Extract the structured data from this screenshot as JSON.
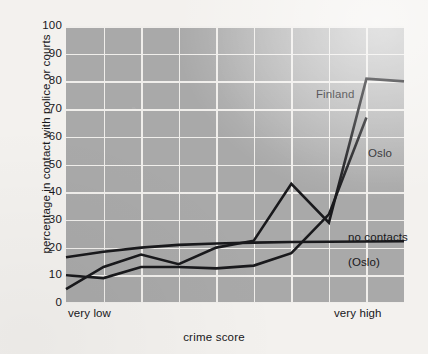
{
  "chart_data": {
    "type": "line",
    "title": "",
    "xlabel": "crime score",
    "ylabel": "percentage in contact with police or courts",
    "ylim": [
      0,
      100
    ],
    "ytick_labels": [
      "0",
      "10",
      "20",
      "30",
      "40",
      "50",
      "60",
      "70",
      "80",
      "90",
      "100"
    ],
    "ytick_values": [
      0,
      10,
      20,
      30,
      40,
      50,
      60,
      70,
      80,
      90,
      100
    ],
    "xtick_labels": [
      "very low",
      "very high"
    ],
    "x_categories": [
      1,
      2,
      3,
      4,
      5,
      6,
      7,
      8,
      9,
      10
    ],
    "grid": true,
    "grid_vertical_count": 8,
    "legend_position": "inline-annotations",
    "plot_background_color": "#a9a9a9",
    "page_background_color": "#f3f1ee",
    "gridline_color": "#f0eeeb",
    "line_color": "#19191c",
    "series": [
      {
        "name": "Finland",
        "label": "Finland",
        "x": [
          1,
          2,
          3,
          4,
          5,
          6,
          7,
          8,
          9,
          10
        ],
        "values": [
          5,
          13,
          17.5,
          14,
          20,
          22.5,
          43,
          29,
          81,
          80
        ]
      },
      {
        "name": "Oslo",
        "label": "Oslo",
        "x": [
          1,
          2,
          3,
          4,
          5,
          6,
          7,
          8,
          9
        ],
        "values": [
          10,
          9,
          13,
          13,
          12.5,
          13.5,
          18,
          32,
          67
        ]
      },
      {
        "name": "no contacts (Oslo)",
        "label": "no contacts",
        "sublabel": "(Oslo)",
        "x": [
          1,
          2,
          3,
          4,
          5,
          6,
          7,
          8,
          9,
          10
        ],
        "values": [
          16.5,
          18.5,
          20,
          21,
          21.5,
          21.8,
          22,
          22.1,
          22.2,
          22.3
        ]
      }
    ],
    "annotations": [
      {
        "text": "Finland",
        "x": 9,
        "y": 73
      },
      {
        "text": "Oslo",
        "x": 9.9,
        "y": 58
      },
      {
        "text": "no contacts",
        "x": 9.2,
        "y": 25
      },
      {
        "text": "(Oslo)",
        "x": 9.2,
        "y": 16
      }
    ]
  }
}
